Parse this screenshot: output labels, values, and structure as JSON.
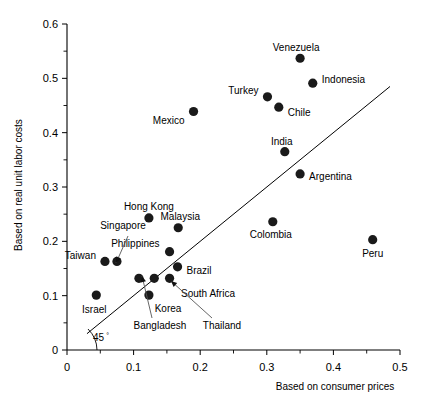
{
  "chart_data": {
    "type": "scatter",
    "title": "",
    "xlabel": "Based on consumer prices",
    "ylabel": "Based on real unit labor costs",
    "xlim": [
      0,
      0.5
    ],
    "ylim": [
      0,
      0.6
    ],
    "xticks": [
      "0",
      "0.1",
      "0.2",
      "0.3",
      "0.4",
      "0.5"
    ],
    "xtick_values": [
      0,
      0.1,
      0.2,
      0.3,
      0.4,
      0.5
    ],
    "yticks": [
      "0",
      "0.1",
      "0.2",
      "0.3",
      "0.4",
      "0.5",
      "0.6"
    ],
    "ytick_values": [
      0,
      0.1,
      0.2,
      0.3,
      0.4,
      0.5,
      0.6
    ],
    "minor_tick_step": 0.05,
    "grid": false,
    "legend": "none",
    "reference_line": {
      "label": "45 °",
      "label_main": "45",
      "label_sup": "°",
      "slope": 1,
      "intercept": 0,
      "x_start": 0.03,
      "x_end": 0.485
    },
    "points": [
      {
        "name": "Venezuela",
        "x": 0.35,
        "y": 0.537,
        "label_dx": -4,
        "label_dy": -11,
        "anchor": "middle"
      },
      {
        "name": "Indonesia",
        "x": 0.369,
        "y": 0.491,
        "label_dx": 9,
        "label_dy": -4,
        "anchor": "start"
      },
      {
        "name": "Turkey",
        "x": 0.301,
        "y": 0.466,
        "label_dx": -9,
        "label_dy": -6,
        "anchor": "end"
      },
      {
        "name": "Chile",
        "x": 0.318,
        "y": 0.447,
        "label_dx": 9,
        "label_dy": 5,
        "anchor": "start"
      },
      {
        "name": "Mexico",
        "x": 0.19,
        "y": 0.439,
        "label_dx": -9,
        "label_dy": 9,
        "anchor": "end"
      },
      {
        "name": "India",
        "x": 0.327,
        "y": 0.365,
        "label_dx": -3,
        "label_dy": -10,
        "anchor": "middle"
      },
      {
        "name": "Argentina",
        "x": 0.35,
        "y": 0.324,
        "label_dx": 9,
        "label_dy": 3,
        "anchor": "start"
      },
      {
        "name": "Hong Kong",
        "x": 0.123,
        "y": 0.243,
        "label_dx": 0,
        "label_dy": -11,
        "anchor": "middle"
      },
      {
        "name": "Malaysia",
        "x": 0.167,
        "y": 0.225,
        "label_dx": 2,
        "label_dy": -11,
        "anchor": "middle"
      },
      {
        "name": "Colombia",
        "x": 0.309,
        "y": 0.236,
        "label_dx": -2,
        "label_dy": 13,
        "anchor": "middle"
      },
      {
        "name": "Peru",
        "x": 0.459,
        "y": 0.203,
        "label_dx": 0,
        "label_dy": 14,
        "anchor": "middle"
      },
      {
        "name": "Philippines",
        "x": 0.154,
        "y": 0.181,
        "label_dx": -10,
        "label_dy": -8,
        "anchor": "end"
      },
      {
        "name": "Brazil",
        "x": 0.166,
        "y": 0.153,
        "label_dx": 9,
        "label_dy": 4,
        "anchor": "start"
      },
      {
        "name": "Taiwan",
        "x": 0.057,
        "y": 0.163,
        "label_dx": -9,
        "label_dy": -6,
        "anchor": "end"
      },
      {
        "name": "Singapore",
        "x": 0.075,
        "y": 0.163,
        "label_dx": 0,
        "label_dy": 0,
        "anchor": "end"
      },
      {
        "name": "Bangladesh",
        "x": 0.108,
        "y": 0.132,
        "label_dx": 0,
        "label_dy": 0,
        "anchor": "middle"
      },
      {
        "name": "Thailand",
        "x": 0.131,
        "y": 0.132,
        "label_dx": 0,
        "label_dy": 0,
        "anchor": "middle"
      },
      {
        "name": "South Africa",
        "x": 0.154,
        "y": 0.132,
        "label_dx": 9,
        "label_dy": 12,
        "anchor": "start"
      },
      {
        "name": "Korea",
        "x": 0.123,
        "y": 0.101,
        "label_dx": 12,
        "label_dy": 12,
        "anchor": "start"
      },
      {
        "name": "Israel",
        "x": 0.044,
        "y": 0.101,
        "label_dx": -2,
        "label_dy": 14,
        "anchor": "middle"
      }
    ],
    "annotation_labels": [
      {
        "name": "Singapore",
        "text": "Singapore",
        "x": 123,
        "y": 229
      },
      {
        "name": "Bangladesh",
        "text": "Bangladesh",
        "x": 160,
        "y": 329
      },
      {
        "name": "Thailand",
        "text": "Thailand",
        "x": 222,
        "y": 329
      },
      {
        "name": "South Africa",
        "text": "South Africa",
        "x": 208,
        "y": 297
      },
      {
        "name": "Korea",
        "text": "Korea",
        "x": 168,
        "y": 312
      }
    ],
    "leader_lines": [
      {
        "name": "singapore-leader",
        "x1": 128,
        "y1": 236,
        "x2": 116,
        "y2": 263,
        "head_at": "start"
      },
      {
        "name": "bangladesh-leader",
        "x1": 152,
        "y1": 318,
        "x2": 142,
        "y2": 276,
        "head_at": "start"
      },
      {
        "name": "thailand-leader",
        "x1": 212,
        "y1": 318,
        "x2": 171,
        "y2": 281,
        "head_at": "start"
      }
    ]
  }
}
